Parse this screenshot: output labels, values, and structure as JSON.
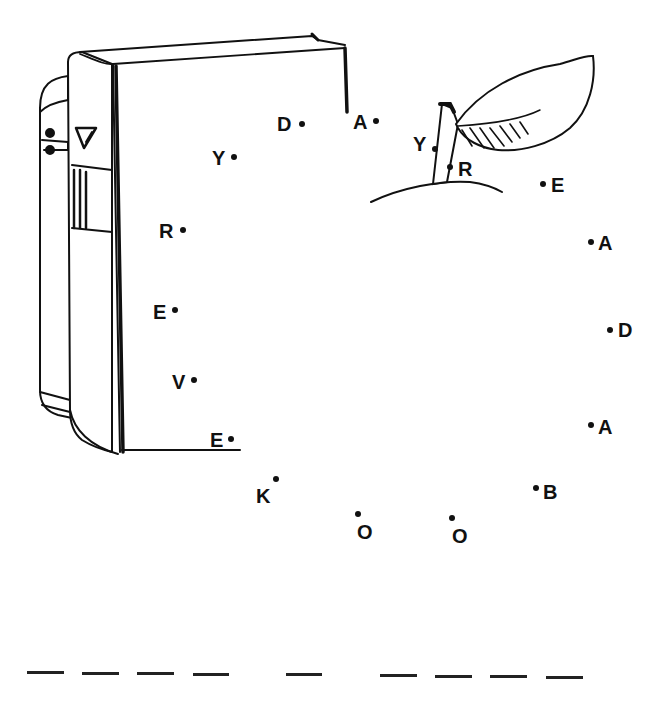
{
  "worksheet": {
    "type": "connect-the-dots",
    "illustrations": [
      "book",
      "apple-with-leaf"
    ],
    "ink_color": "#111111",
    "background": "#ffffff"
  },
  "dots": [
    {
      "letter": "D",
      "dot_x": 302,
      "dot_y": 124,
      "label_x": 277,
      "label_y": 114
    },
    {
      "letter": "A",
      "dot_x": 376,
      "dot_y": 121,
      "label_x": 353,
      "label_y": 112
    },
    {
      "letter": "Y",
      "dot_x": 234,
      "dot_y": 157,
      "label_x": 212,
      "label_y": 148
    },
    {
      "letter": "Y",
      "dot_x": 435,
      "dot_y": 149,
      "label_x": 413,
      "label_y": 134
    },
    {
      "letter": "R",
      "dot_x": 450,
      "dot_y": 167,
      "label_x": 458,
      "label_y": 159
    },
    {
      "letter": "E",
      "dot_x": 543,
      "dot_y": 184,
      "label_x": 551,
      "label_y": 175
    },
    {
      "letter": "R",
      "dot_x": 183,
      "dot_y": 230,
      "label_x": 159,
      "label_y": 221
    },
    {
      "letter": "A",
      "dot_x": 591,
      "dot_y": 242,
      "label_x": 598,
      "label_y": 233
    },
    {
      "letter": "E",
      "dot_x": 175,
      "dot_y": 310,
      "label_x": 153,
      "label_y": 302
    },
    {
      "letter": "D",
      "dot_x": 610,
      "dot_y": 330,
      "label_x": 618,
      "label_y": 320
    },
    {
      "letter": "V",
      "dot_x": 194,
      "dot_y": 380,
      "label_x": 172,
      "label_y": 372
    },
    {
      "letter": "A",
      "dot_x": 591,
      "dot_y": 425,
      "label_x": 598,
      "label_y": 417
    },
    {
      "letter": "E",
      "dot_x": 231,
      "dot_y": 439,
      "label_x": 210,
      "label_y": 430
    },
    {
      "letter": "K",
      "dot_x": 276,
      "dot_y": 479,
      "label_x": 256,
      "label_y": 486
    },
    {
      "letter": "B",
      "dot_x": 536,
      "dot_y": 488,
      "label_x": 543,
      "label_y": 482
    },
    {
      "letter": "O",
      "dot_x": 358,
      "dot_y": 514,
      "label_x": 357,
      "label_y": 522
    },
    {
      "letter": "O",
      "dot_x": 452,
      "dot_y": 518,
      "label_x": 452,
      "label_y": 526
    }
  ],
  "answer_blanks": {
    "groups": [
      4,
      1,
      4
    ],
    "segments": [
      {
        "x": 27,
        "y": 671,
        "w": 37
      },
      {
        "x": 64,
        "y": 671,
        "w": 0
      },
      {
        "x": 82,
        "y": 672,
        "w": 37
      },
      {
        "x": 137,
        "y": 672,
        "w": 37
      },
      {
        "x": 193,
        "y": 673,
        "w": 36
      },
      {
        "x": 286,
        "y": 673,
        "w": 36
      },
      {
        "x": 380,
        "y": 674,
        "w": 37
      },
      {
        "x": 435,
        "y": 675,
        "w": 37
      },
      {
        "x": 490,
        "y": 675,
        "w": 37
      },
      {
        "x": 546,
        "y": 676,
        "w": 37
      }
    ]
  }
}
